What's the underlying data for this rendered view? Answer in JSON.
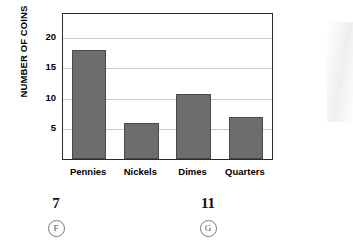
{
  "chart_data": {
    "type": "bar",
    "title": "",
    "subtitle": "",
    "xlabel": "",
    "ylabel": "NUMBER OF COINS",
    "categories": [
      "Pennies",
      "Nickels",
      "Dimes",
      "Quarters"
    ],
    "values": [
      18,
      6,
      10.7,
      7
    ],
    "ylim": [
      0,
      24
    ],
    "yticks": [
      5,
      10,
      15,
      20
    ],
    "ytick_labels": [
      "5",
      "10",
      "15",
      "20"
    ],
    "grid": true,
    "legend": "none",
    "bar_color": "#6d6d6d",
    "bar_edge_color": "#4a4a4a",
    "axis_color": "#2b2b2b",
    "gridline_color": "#c9c9c9"
  },
  "answers": {
    "choices": [
      {
        "value": "7",
        "letter": "F"
      },
      {
        "value": "11",
        "letter": "G"
      }
    ]
  }
}
